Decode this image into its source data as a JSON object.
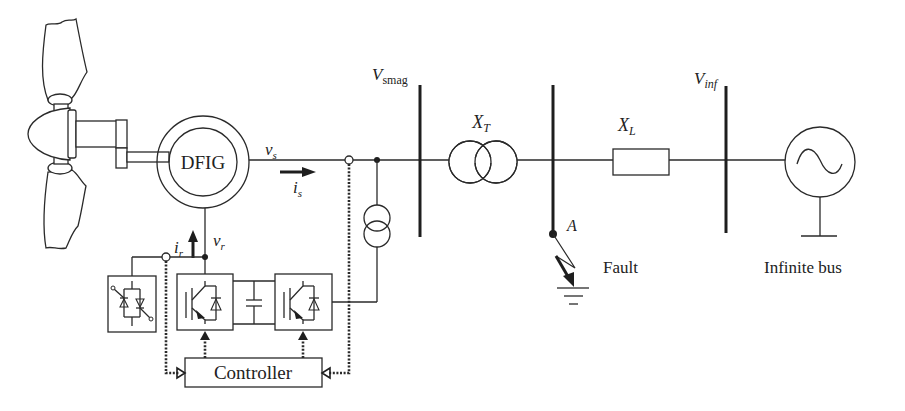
{
  "diagram": {
    "title": "",
    "components": {
      "generator": "DFIG",
      "controller": "Controller",
      "fault": "Fault",
      "infinite_bus": "Infinite bus",
      "fault_point": "A"
    },
    "labels": {
      "stator_voltage": {
        "main": "v",
        "sub": "s"
      },
      "stator_current": {
        "main": "i",
        "sub": "s"
      },
      "rotor_current": {
        "main": "i",
        "sub": "r"
      },
      "rotor_voltage": {
        "main": "v",
        "sub": "r"
      },
      "bus_vsmag": {
        "main": "V",
        "sub": "smag"
      },
      "bus_vinf": {
        "main": "V",
        "sub": "inf"
      },
      "transformer_reactance": {
        "main": "X",
        "sub": "T"
      },
      "line_reactance": {
        "main": "X",
        "sub": "L"
      }
    },
    "colors": {
      "ink": "#222222",
      "background": "#ffffff"
    }
  }
}
